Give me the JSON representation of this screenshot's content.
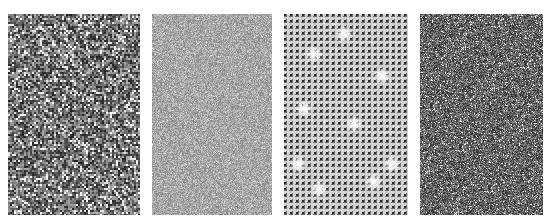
{
  "figure": {
    "background": "#ffffff",
    "panels": [
      {
        "id": "panel-1",
        "texture": "coarse-speckle-noise",
        "left": 8,
        "width": 132,
        "base_gray": "#777777"
      },
      {
        "id": "panel-2",
        "texture": "fine-light-noise",
        "left": 152,
        "width": 120,
        "base_gray": "#aaaaaa"
      },
      {
        "id": "panel-3",
        "texture": "dot-grid-with-sparkles",
        "left": 284,
        "width": 124,
        "base_gray": "#c8c8c8"
      },
      {
        "id": "panel-4",
        "texture": "fine-dark-noise",
        "left": 420,
        "width": 123,
        "base_gray": "#6a6a6a"
      }
    ]
  }
}
